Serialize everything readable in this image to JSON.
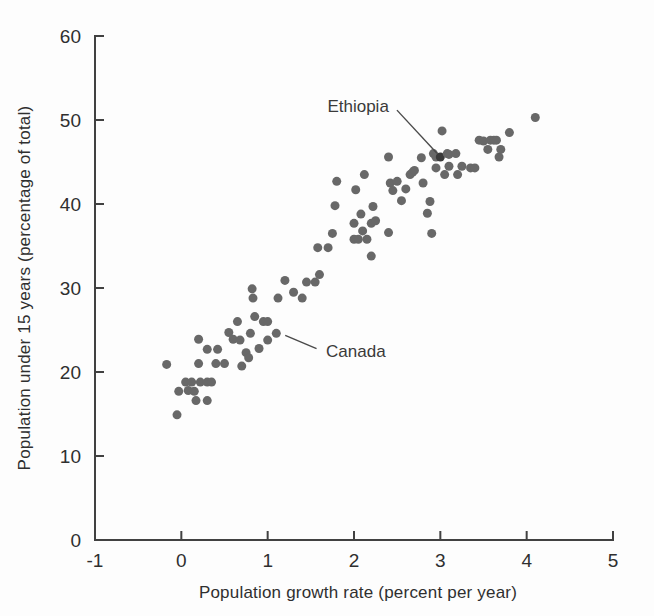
{
  "chart_data": {
    "type": "scatter",
    "title": "",
    "xlabel": "Population growth rate (percent per year)",
    "ylabel": "Population under 15 years (percentage of total)",
    "xlim": [
      -1,
      5
    ],
    "ylim": [
      0,
      60
    ],
    "xticks": [
      -1,
      0,
      1,
      2,
      3,
      4,
      5
    ],
    "xticklabels": [
      "-1",
      "0",
      "1",
      "2",
      "3",
      "4",
      "5"
    ],
    "yticks": [
      0,
      10,
      20,
      30,
      40,
      50,
      60
    ],
    "yticklabels": [
      "0",
      "10",
      "20",
      "30",
      "40",
      "50",
      "60"
    ],
    "grid": false,
    "legend": null,
    "marker_color": "#686868",
    "highlight_color": "#3a3a3a",
    "marker_size": 9,
    "points": [
      [
        -0.17,
        20.9
      ],
      [
        -0.05,
        14.9
      ],
      [
        -0.03,
        17.7
      ],
      [
        0.05,
        18.8
      ],
      [
        0.08,
        17.8
      ],
      [
        0.12,
        18.8
      ],
      [
        0.15,
        17.7
      ],
      [
        0.17,
        16.6
      ],
      [
        0.2,
        21.0
      ],
      [
        0.2,
        23.9
      ],
      [
        0.22,
        18.8
      ],
      [
        0.3,
        18.8
      ],
      [
        0.3,
        22.7
      ],
      [
        0.3,
        16.6
      ],
      [
        0.35,
        18.8
      ],
      [
        0.4,
        21.0
      ],
      [
        0.42,
        22.7
      ],
      [
        0.5,
        21.0
      ],
      [
        0.55,
        24.7
      ],
      [
        0.6,
        23.9
      ],
      [
        0.65,
        26.0
      ],
      [
        0.68,
        23.8
      ],
      [
        0.7,
        20.7
      ],
      [
        0.75,
        22.3
      ],
      [
        0.78,
        21.7
      ],
      [
        0.8,
        24.6
      ],
      [
        0.82,
        29.9
      ],
      [
        0.83,
        28.8
      ],
      [
        0.85,
        26.6
      ],
      [
        0.9,
        22.8
      ],
      [
        0.95,
        26.0
      ],
      [
        1.0,
        26.0
      ],
      [
        1.0,
        23.8
      ],
      [
        1.1,
        24.6
      ],
      [
        1.12,
        28.8
      ],
      [
        1.2,
        30.9
      ],
      [
        1.3,
        29.5
      ],
      [
        1.4,
        28.8
      ],
      [
        1.45,
        30.7
      ],
      [
        1.55,
        30.7
      ],
      [
        1.58,
        34.8
      ],
      [
        1.6,
        31.6
      ],
      [
        1.7,
        34.8
      ],
      [
        1.75,
        36.5
      ],
      [
        1.78,
        39.8
      ],
      [
        1.8,
        42.7
      ],
      [
        2.0,
        35.8
      ],
      [
        2.0,
        37.7
      ],
      [
        2.02,
        41.7
      ],
      [
        2.05,
        35.8
      ],
      [
        2.08,
        38.8
      ],
      [
        2.1,
        36.8
      ],
      [
        2.12,
        43.5
      ],
      [
        2.15,
        35.8
      ],
      [
        2.2,
        37.7
      ],
      [
        2.2,
        33.8
      ],
      [
        2.22,
        39.7
      ],
      [
        2.25,
        38.0
      ],
      [
        2.4,
        36.6
      ],
      [
        2.4,
        45.6
      ],
      [
        2.42,
        42.5
      ],
      [
        2.45,
        41.6
      ],
      [
        2.5,
        42.7
      ],
      [
        2.55,
        40.4
      ],
      [
        2.6,
        41.8
      ],
      [
        2.65,
        43.5
      ],
      [
        2.68,
        43.8
      ],
      [
        2.7,
        44.0
      ],
      [
        2.78,
        45.5
      ],
      [
        2.8,
        42.5
      ],
      [
        2.85,
        38.9
      ],
      [
        2.88,
        40.3
      ],
      [
        2.9,
        36.5
      ],
      [
        2.92,
        46.0
      ],
      [
        2.95,
        45.6
      ],
      [
        2.95,
        44.3
      ],
      [
        3.0,
        45.6
      ],
      [
        3.02,
        48.7
      ],
      [
        3.05,
        43.5
      ],
      [
        3.08,
        46.0
      ],
      [
        3.1,
        45.9
      ],
      [
        3.1,
        44.5
      ],
      [
        3.18,
        46.0
      ],
      [
        3.2,
        43.5
      ],
      [
        3.25,
        44.5
      ],
      [
        3.35,
        44.3
      ],
      [
        3.4,
        44.3
      ],
      [
        3.45,
        47.6
      ],
      [
        3.5,
        47.5
      ],
      [
        3.55,
        46.5
      ],
      [
        3.58,
        47.6
      ],
      [
        3.62,
        47.6
      ],
      [
        3.65,
        47.6
      ],
      [
        3.68,
        45.6
      ],
      [
        3.7,
        46.5
      ],
      [
        3.8,
        48.5
      ],
      [
        4.1,
        50.3
      ]
    ],
    "annotations": [
      {
        "label": "Ethiopia",
        "point": [
          3.0,
          45.6
        ],
        "label_x": 2.45,
        "label_y": 51.7
      },
      {
        "label": "Canada",
        "point": [
          1.15,
          24.6
        ],
        "label_x": 1.63,
        "label_y": 22.5
      }
    ]
  },
  "axes": {
    "x_axis_name": "Population growth rate (percent per year)",
    "y_axis_name": "Population under 15 years (percentage of total)"
  }
}
